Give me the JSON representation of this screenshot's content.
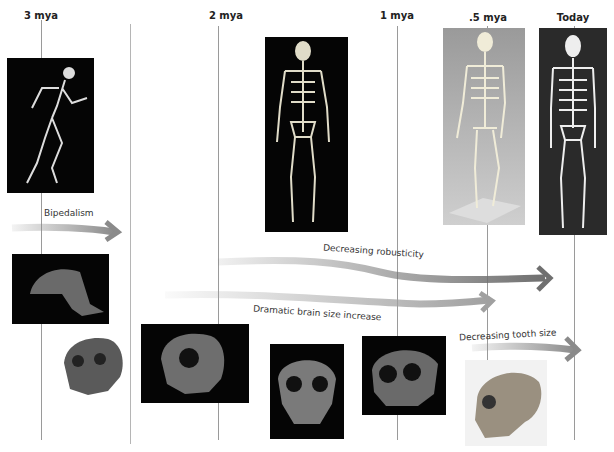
{
  "timeline": {
    "labels": [
      {
        "text": "3 mya",
        "x": 28
      },
      {
        "text": "2 mya",
        "x": 228
      },
      {
        "text": "1 mya",
        "x": 397
      },
      {
        "text": ".5 mya",
        "x": 488
      },
      {
        "text": "Today",
        "x": 573
      }
    ]
  },
  "trends": [
    {
      "label": "Bipedalism",
      "color": "#8a8a8a"
    },
    {
      "label": "Decreasing robusticity",
      "color": "#6f6f6f"
    },
    {
      "label": "Dramatic brain size increase",
      "color": "#a0a0a0"
    },
    {
      "label": "Decreasing tooth size",
      "color": "#8a8a8a"
    }
  ],
  "images": {
    "skeletons": [
      "hunched-skeleton",
      "early-homo-skeleton",
      "archaic-skeleton-on-stand",
      "modern-human-skeleton"
    ],
    "skulls": [
      "ape-like-skull-profile",
      "robust-face-skull",
      "early-homo-skull",
      "erectus-skull-front",
      "heidelbergensis-skull",
      "neanderthal-skull-profile"
    ]
  }
}
